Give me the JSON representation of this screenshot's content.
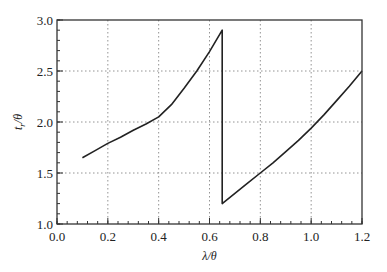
{
  "chart_data": {
    "type": "line",
    "title": "",
    "xlabel": "λ/θ",
    "ylabel": "tr/θ",
    "ylabel_main": "t",
    "ylabel_sub": "r",
    "ylabel_tail": "/θ",
    "xlim": [
      0.0,
      1.2
    ],
    "ylim": [
      1.0,
      3.0
    ],
    "xticks": [
      "0.0",
      "0.2",
      "0.4",
      "0.6",
      "0.8",
      "1.0",
      "1.2"
    ],
    "yticks": [
      "1.0",
      "1.5",
      "2.0",
      "2.5",
      "3.0"
    ],
    "x_minor_step": 0.04,
    "y_minor_step": 0.1,
    "grid": true,
    "legend": null,
    "series": [
      {
        "name": "tr/θ",
        "color": "#222222",
        "x": [
          0.1,
          0.15,
          0.2,
          0.25,
          0.3,
          0.35,
          0.4,
          0.45,
          0.5,
          0.55,
          0.6,
          0.65,
          0.65,
          0.7,
          0.75,
          0.8,
          0.85,
          0.9,
          0.95,
          1.0,
          1.05,
          1.1,
          1.15,
          1.2
        ],
        "y": [
          1.65,
          1.72,
          1.79,
          1.85,
          1.92,
          1.98,
          2.05,
          2.17,
          2.33,
          2.5,
          2.69,
          2.9,
          1.2,
          1.3,
          1.4,
          1.5,
          1.6,
          1.71,
          1.82,
          1.94,
          2.07,
          2.21,
          2.35,
          2.5
        ]
      }
    ]
  },
  "layout": {
    "plot_left": 57,
    "plot_right": 362,
    "plot_top": 20,
    "plot_bottom": 224
  }
}
